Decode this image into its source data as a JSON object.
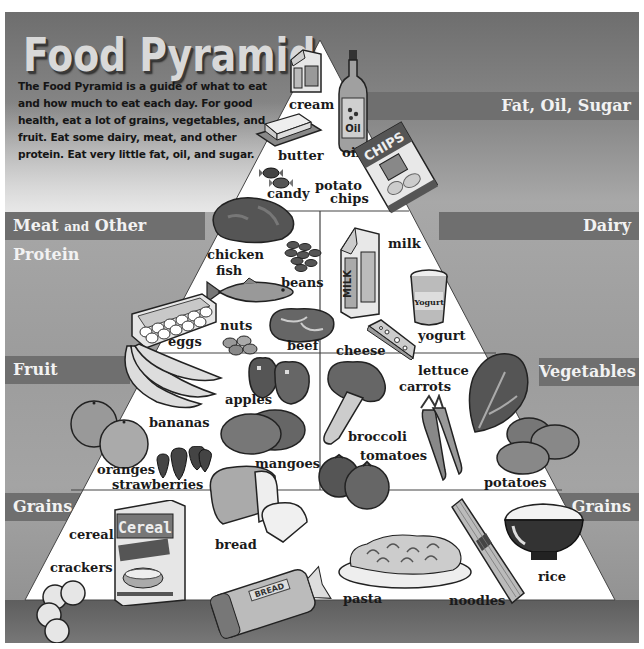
{
  "title": "Food Pyramid",
  "intro_text": "The Food Pyramid is a guide of what to eat and how much to eat each day. For good health, eat a lot of grains, vegetables, and fruit. Eat some dairy, meat, and other protein. Eat very little fat, oil, and sugar.",
  "groups": {
    "fat_oil_sugar": "Fat, Oil, Sugar",
    "meat_main": "Meat",
    "meat_and": "and",
    "meat_rest": "Other Protein",
    "dairy": "Dairy",
    "fruit": "Fruit",
    "vegetables": "Vegetables",
    "grains_left": "Grains",
    "grains_right": "Grains"
  },
  "foods": {
    "fat_oil_sugar": [
      "cream",
      "oil",
      "butter",
      "candy",
      "potato chips"
    ],
    "meat_protein": [
      "chicken",
      "fish",
      "beans",
      "eggs",
      "nuts",
      "beef"
    ],
    "dairy": [
      "milk",
      "yogurt",
      "cheese"
    ],
    "fruit": [
      "apples",
      "bananas",
      "oranges",
      "strawberries",
      "mangoes"
    ],
    "vegetables": [
      "lettuce",
      "carrots",
      "broccoli",
      "tomatoes",
      "potatoes"
    ],
    "grains": [
      "cereal",
      "crackers",
      "bread",
      "pasta",
      "noodles",
      "rice"
    ]
  },
  "labels": {
    "cream": "cream",
    "oil": "oil",
    "butter": "butter",
    "candy": "candy",
    "potato": "potato",
    "chips": "chips",
    "chicken": "chicken",
    "fish": "fish",
    "beans": "beans",
    "eggs": "eggs",
    "nuts": "nuts",
    "beef": "beef",
    "milk": "milk",
    "yogurt": "yogurt",
    "cheese": "cheese",
    "apples": "apples",
    "bananas": "bananas",
    "oranges": "oranges",
    "strawberries": "strawberries",
    "mangoes": "mangoes",
    "lettuce": "lettuce",
    "carrots": "carrots",
    "broccoli": "broccoli",
    "tomatoes": "tomatoes",
    "potatoes": "potatoes",
    "cereal": "cereal",
    "crackers": "crackers",
    "bread": "bread",
    "pasta": "pasta",
    "noodles": "noodles",
    "rice": "rice"
  },
  "package_text": {
    "oil_bottle": "Oil",
    "chips_bag": "CHIPS",
    "milk_carton": "MILK",
    "yogurt_cup": "Yogurt",
    "cereal_box": "Cereal",
    "bread_bag": "BREAD"
  },
  "colors": {
    "band": "#6f6f6f",
    "pyramid_fill": "#ffffff",
    "background_dark": "#6e6e6e",
    "background_light": "#a8a8a8",
    "bottom_band": "#5e5e5e"
  }
}
